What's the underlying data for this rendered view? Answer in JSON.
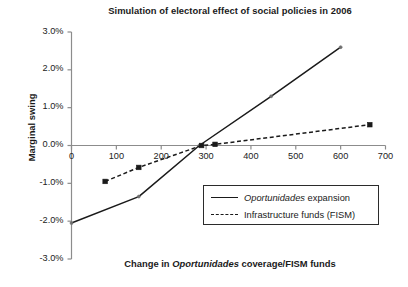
{
  "chart_data": {
    "type": "line",
    "title": "Simulation of electoral effect of social policies in 2006",
    "title_parts": [
      {
        "text": "Simulation of electoral effect of social policies in 2006",
        "italic": false
      }
    ],
    "xlabel": "Change in Oportunidades coverage/FISM funds",
    "xlabel_parts": [
      {
        "text": "Change in ",
        "italic": false
      },
      {
        "text": "Oportunidades",
        "italic": true
      },
      {
        "text": " coverage/FISM funds",
        "italic": false
      }
    ],
    "ylabel": "Marginal swing",
    "xlim": [
      0,
      700
    ],
    "ylim": [
      -3.0,
      3.0
    ],
    "xticks": [
      0,
      100,
      200,
      300,
      400,
      500,
      600,
      700
    ],
    "xtick_labels": [
      "0",
      "100",
      "200",
      "300",
      "400",
      "500",
      "600",
      "700"
    ],
    "yticks": [
      3.0,
      2.0,
      1.0,
      0.0,
      -1.0,
      -2.0,
      -3.0
    ],
    "ytick_labels": [
      "3.0%",
      "2.0%",
      "1.0%",
      "0.0%",
      "-1.0%",
      "-2.0%",
      "-3.0%"
    ],
    "y_unit": "%",
    "grid": false,
    "zero_line": true,
    "legend_position": "lower-right-inside",
    "series": [
      {
        "name": "Oportunidades expansion",
        "name_parts": [
          {
            "text": "Oportunidades",
            "italic": true
          },
          {
            "text": " expansion",
            "italic": false
          }
        ],
        "style": "solid",
        "color": "#1a1a1a",
        "marker": "small-dot",
        "x": [
          0,
          150,
          285,
          445,
          600
        ],
        "y": [
          -2.05,
          -1.35,
          0.0,
          1.3,
          2.6
        ]
      },
      {
        "name": "Infrastructure funds (FISM)",
        "name_parts": [
          {
            "text": "Infrastructure funds (FISM)",
            "italic": false
          }
        ],
        "style": "dashed",
        "color": "#1a1a1a",
        "marker": "square",
        "x": [
          75,
          150,
          290,
          320,
          665
        ],
        "y": [
          -0.95,
          -0.58,
          0.0,
          0.03,
          0.55
        ]
      }
    ]
  },
  "legend": {
    "items": [
      {
        "label": "Oportunidades expansion",
        "style": "solid"
      },
      {
        "label": "Infrastructure funds (FISM)",
        "style": "dashed"
      }
    ]
  }
}
